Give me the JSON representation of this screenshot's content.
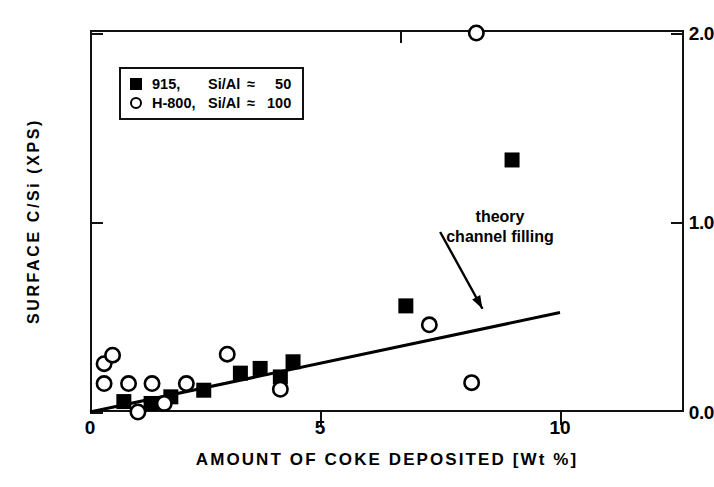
{
  "chart_data": {
    "type": "scatter",
    "title": "",
    "xlabel": "AMOUNT OF COKE DEPOSITED [Wt %]",
    "ylabel": "SURFACE C/Si (XPS)",
    "xlim": [
      0,
      12.6
    ],
    "ylim": [
      0.0,
      2.02
    ],
    "xticks": [
      0,
      5,
      10
    ],
    "xticklabels": [
      "0",
      "5",
      "10"
    ],
    "yticks": [
      0.0,
      1.0,
      2.0
    ],
    "yticklabels": [
      "0.0",
      "1.0",
      "2.0"
    ],
    "grid": false,
    "legend_position": "upper-left-inside",
    "series": [
      {
        "name": "915,  Si/Al ≈ 50",
        "marker": "filled-square",
        "color": "#000000",
        "points": [
          [
            0.72,
            0.055
          ],
          [
            1.3,
            0.045
          ],
          [
            1.72,
            0.08
          ],
          [
            2.42,
            0.115
          ],
          [
            3.2,
            0.205
          ],
          [
            3.62,
            0.23
          ],
          [
            4.32,
            0.265
          ],
          [
            4.05,
            0.185
          ],
          [
            6.72,
            0.56
          ],
          [
            8.98,
            1.33
          ]
        ]
      },
      {
        "name": "H-800, Si/Al ≈ 100",
        "marker": "open-circle",
        "color": "#000000",
        "points": [
          [
            0.3,
            0.255
          ],
          [
            0.48,
            0.3
          ],
          [
            0.3,
            0.15
          ],
          [
            0.82,
            0.15
          ],
          [
            1.32,
            0.15
          ],
          [
            2.05,
            0.15
          ],
          [
            1.02,
            0.0
          ],
          [
            1.58,
            0.045
          ],
          [
            2.92,
            0.305
          ],
          [
            4.05,
            0.12
          ],
          [
            7.22,
            0.46
          ],
          [
            8.12,
            0.155
          ],
          [
            8.22,
            2.0
          ]
        ]
      }
    ],
    "annotations": [
      {
        "text_line1": "theory",
        "text_line2": "channel filling",
        "x": 7.4,
        "y": 1.02,
        "arrow_to_x": 8.35,
        "arrow_to_y": 0.545
      }
    ],
    "lines": [
      {
        "name": "theory-channel-filling",
        "style": "solid",
        "from": [
          0.0,
          0.0
        ],
        "to": [
          10.0,
          0.525
        ]
      }
    ]
  },
  "legend": {
    "rows": [
      {
        "marker": "filled-square",
        "name": "915,",
        "ratio": "Si/Al",
        "approx": "≈",
        "value": "50"
      },
      {
        "marker": "open-circle",
        "name": "H-800,",
        "ratio": "Si/Al",
        "approx": "≈",
        "value": "100"
      }
    ]
  },
  "axes": {
    "x_title": "AMOUNT OF COKE DEPOSITED [Wt %]",
    "y_title": "SURFACE C/Si (XPS)",
    "x_tick_labels": [
      "0",
      "5",
      "10"
    ],
    "y_tick_labels": [
      "0.0",
      "1.0",
      "2.0"
    ]
  },
  "annotation": {
    "line1": "theory",
    "line2": "channel filling"
  }
}
